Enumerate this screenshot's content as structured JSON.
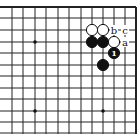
{
  "diagram": {
    "type": "go-board-fragment",
    "corner": "top-right",
    "grid": {
      "columns_x": [
        12,
        23,
        35,
        46,
        58,
        69,
        81,
        92,
        103,
        114,
        125,
        136
      ],
      "rows_y": [
        7,
        18,
        30,
        42,
        53,
        65,
        76,
        88,
        99,
        111,
        122,
        133
      ],
      "line_color": "#222222",
      "edge_top": true,
      "edge_right": true
    },
    "star_points": [
      {
        "col": 2,
        "row": 3
      },
      {
        "col": 2,
        "row": 9
      },
      {
        "col": 8,
        "row": 9
      }
    ],
    "stones": [
      {
        "color": "white",
        "col": 7,
        "row": 2,
        "label": ""
      },
      {
        "color": "white",
        "col": 8,
        "row": 2,
        "label": ""
      },
      {
        "color": "black",
        "col": 7,
        "row": 3,
        "label": ""
      },
      {
        "color": "black",
        "col": 8,
        "row": 3,
        "label": ""
      },
      {
        "color": "white",
        "col": 9,
        "row": 3,
        "label": ""
      },
      {
        "color": "black",
        "col": 9,
        "row": 4,
        "label": "1"
      },
      {
        "color": "black",
        "col": 8,
        "row": 5,
        "label": ""
      }
    ],
    "point_labels": [
      {
        "text": "b",
        "col": 9,
        "row": 2
      },
      {
        "text": "c",
        "col": 10,
        "row": 2
      },
      {
        "text": "a",
        "col": 10,
        "row": 3
      }
    ]
  }
}
